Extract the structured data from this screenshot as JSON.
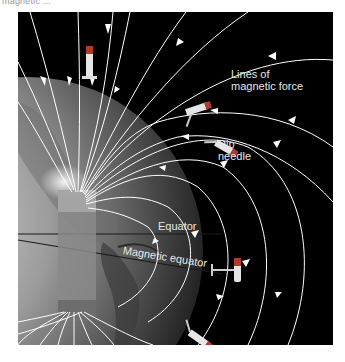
{
  "figure": {
    "top_caption_partial": "magnetic ...",
    "labels": {
      "lines_of_force_1": "Lines of",
      "lines_of_force_2": "magnetic force",
      "dip_needle_1": "Dip",
      "dip_needle_2": "needle",
      "equator": "Equator",
      "magnetic_equator": "Magnetic equator"
    },
    "colors": {
      "background": "#000000",
      "field_lines": "#ffffff",
      "globe_light": "#b8b8b8",
      "globe_dark": "#3a3a3a",
      "bar_magnet": "#7a7a7a",
      "needle_red": "#b23a2a"
    }
  }
}
